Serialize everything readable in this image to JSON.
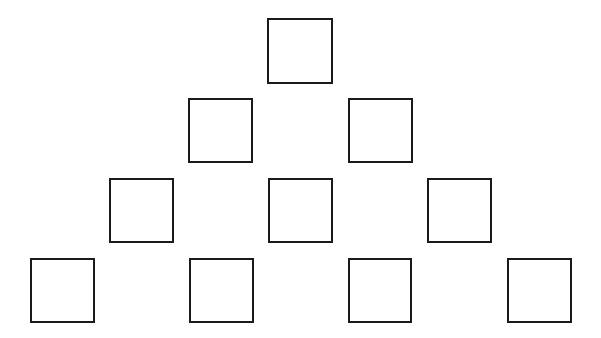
{
  "diagram": {
    "type": "pyramid-of-boxes",
    "rows": [
      {
        "row": 1,
        "boxes": [
          {
            "x": 267,
            "y": 18,
            "w": 66,
            "h": 66
          }
        ]
      },
      {
        "row": 2,
        "boxes": [
          {
            "x": 188,
            "y": 98,
            "w": 65,
            "h": 65
          },
          {
            "x": 348,
            "y": 98,
            "w": 65,
            "h": 65
          }
        ]
      },
      {
        "row": 3,
        "boxes": [
          {
            "x": 109,
            "y": 178,
            "w": 65,
            "h": 65
          },
          {
            "x": 268,
            "y": 178,
            "w": 65,
            "h": 65
          },
          {
            "x": 427,
            "y": 178,
            "w": 65,
            "h": 65
          }
        ]
      },
      {
        "row": 4,
        "boxes": [
          {
            "x": 30,
            "y": 258,
            "w": 65,
            "h": 65
          },
          {
            "x": 189,
            "y": 258,
            "w": 65,
            "h": 65
          },
          {
            "x": 348,
            "y": 258,
            "w": 64,
            "h": 65
          },
          {
            "x": 507,
            "y": 258,
            "w": 65,
            "h": 65
          }
        ]
      }
    ],
    "colors": {
      "stroke": "#1a1a1a",
      "fill": "#ffffff",
      "background": "#ffffff"
    }
  }
}
